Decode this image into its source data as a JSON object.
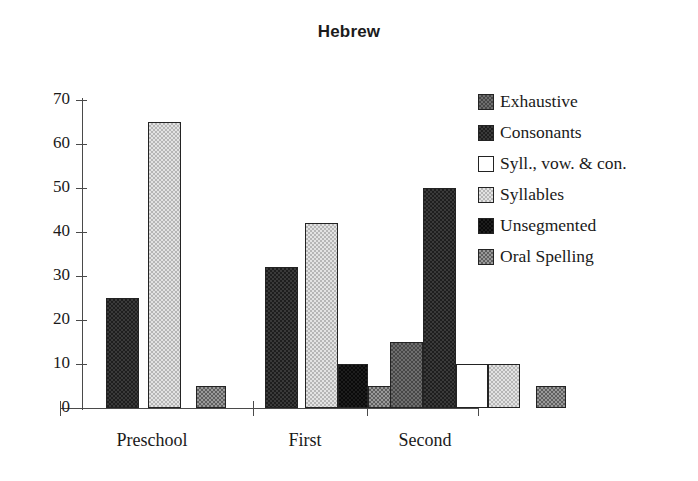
{
  "chart_data": {
    "type": "bar",
    "title": "Hebrew",
    "xlabel": "",
    "ylabel": "",
    "ylim": [
      0,
      70
    ],
    "yticks": [
      0,
      10,
      20,
      30,
      40,
      50,
      60,
      70
    ],
    "grid": false,
    "legend_position": "right",
    "categories": [
      "Preschool",
      "First",
      "Second"
    ],
    "series": [
      {
        "name": "Exhaustive",
        "key": "exhaustive",
        "swatch": "medium-dark-checker",
        "values": [
          0,
          0,
          15
        ]
      },
      {
        "name": "Consonants",
        "key": "consonants",
        "swatch": "dark-checker",
        "values": [
          25,
          32,
          50
        ]
      },
      {
        "name": "Syll., vow. & con.",
        "key": "syllvowcon",
        "swatch": "white",
        "values": [
          0,
          0,
          10
        ]
      },
      {
        "name": "Syllables",
        "key": "syllables",
        "swatch": "light-checker",
        "values": [
          65,
          42,
          10
        ]
      },
      {
        "name": "Unsegmented",
        "key": "unsegmented",
        "swatch": "black",
        "values": [
          0,
          10,
          0
        ]
      },
      {
        "name": "Oral Spelling",
        "key": "oralspelling",
        "swatch": "medium-checker",
        "values": [
          5,
          5,
          5
        ]
      }
    ]
  },
  "axis": {
    "tick_labels": [
      "70",
      "60",
      "50",
      "40",
      "30",
      "20",
      "10",
      "0"
    ],
    "group_labels": [
      "Preschool",
      "First",
      "Second"
    ]
  },
  "legend": {
    "items": [
      {
        "label": "Exhaustive"
      },
      {
        "label": "Consonants"
      },
      {
        "label": "Syll., vow. & con."
      },
      {
        "label": "Syllables"
      },
      {
        "label": "Unsegmented"
      },
      {
        "label": "Oral Spelling"
      }
    ]
  },
  "colors": {
    "axis": "#4a4a4a",
    "text": "#1a1a1a",
    "bar_outline": "#232323",
    "background": "#ffffff"
  }
}
